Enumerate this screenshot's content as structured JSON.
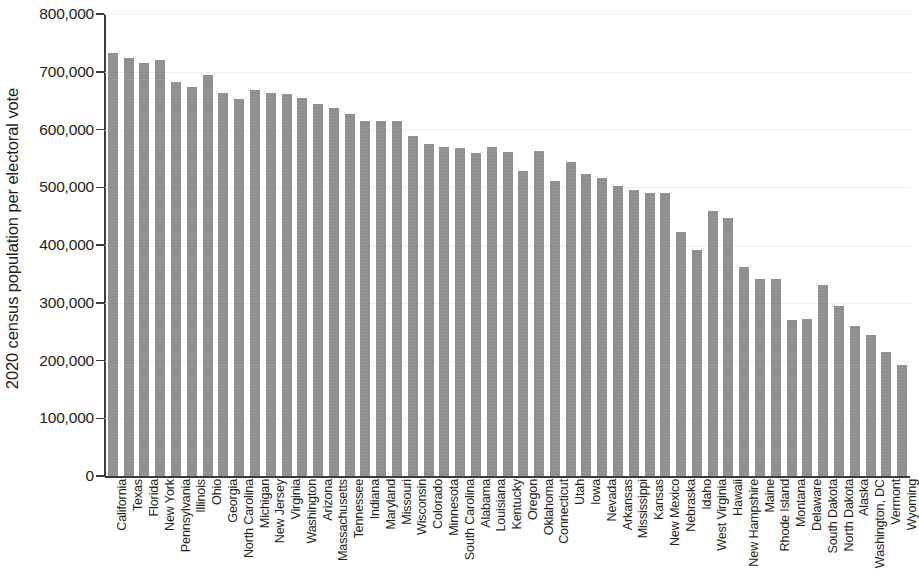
{
  "chart_data": {
    "type": "bar",
    "title": "",
    "subtitle": "",
    "xlabel": "",
    "ylabel": "2020 census population per electoral vote",
    "ylim": [
      0,
      800000
    ],
    "ytick_values": [
      0,
      100000,
      200000,
      300000,
      400000,
      500000,
      600000,
      700000,
      800000
    ],
    "ytick_labels": [
      "0",
      "100,000",
      "200,000",
      "300,000",
      "400,000",
      "500,000",
      "600,000",
      "700,000",
      "800,000"
    ],
    "grid": true,
    "legend": null,
    "bar_color": "#909090",
    "axis_color": "#3b3b3b",
    "text_color": "#231f20",
    "categories": [
      "California",
      "Texas",
      "Florida",
      "New York",
      "Pennsylvania",
      "Illinois",
      "Ohio",
      "Georgia",
      "North Carolina",
      "Michigan",
      "New Jersey",
      "Virginia",
      "Washington",
      "Arizona",
      "Massachusetts",
      "Tennessee",
      "Indiana",
      "Maryland",
      "Missouri",
      "Wisconsin",
      "Colorado",
      "Minnesota",
      "South Carolina",
      "Alabama",
      "Louisiana",
      "Kentucky",
      "Oregon",
      "Oklahoma",
      "Connecticut",
      "Utah",
      "Iowa",
      "Nevada",
      "Arkansas",
      "Mississippi",
      "Kansas",
      "New Mexico",
      "Nebraska",
      "Idaho",
      "West Virginia",
      "Hawaii",
      "New Hampshire",
      "Maine",
      "Rhode Island",
      "Montana",
      "Delaware",
      "South Dakota",
      "North Dakota",
      "Alaska",
      "Washington, DC",
      "Vermont",
      "Wyoming"
    ],
    "values": [
      732189,
      724000,
      716000,
      721000,
      682000,
      673000,
      694000,
      664000,
      653000,
      669000,
      664000,
      662000,
      655000,
      645000,
      637000,
      627000,
      614000,
      614000,
      614000,
      588000,
      575000,
      569000,
      568000,
      559000,
      569000,
      561000,
      528000,
      563000,
      510000,
      543000,
      523000,
      516000,
      502000,
      496000,
      490000,
      490000,
      422000,
      391000,
      459000,
      447000,
      362000,
      341000,
      341000,
      271000,
      272000,
      330000,
      294000,
      259000,
      244000,
      215000,
      193000
    ]
  }
}
